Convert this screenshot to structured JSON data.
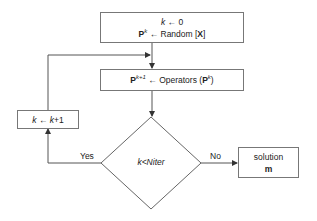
{
  "diagram": {
    "type": "flowchart",
    "init_box": {
      "line1": {
        "var": "k",
        "arrow": "←",
        "value": "0"
      },
      "line2": {
        "var": "P",
        "sup": "k",
        "arrow": "←",
        "func": "Random [",
        "arg": "X",
        "close": "]"
      }
    },
    "operators_box": {
      "var": "P",
      "sup": "k+1",
      "arrow": "←",
      "func": "Operators (",
      "arg": "P",
      "arg_sup": "k",
      "close": ")"
    },
    "increment_box": {
      "var": "k",
      "arrow": "←",
      "expr_var": "k",
      "expr_rest": "+1"
    },
    "decision": {
      "label": "k<Niter"
    },
    "solution_box": {
      "line1": "solution",
      "line2": "m"
    },
    "edges": {
      "yes_label": "Yes",
      "no_label": "No"
    },
    "colors": {
      "line": "#555555",
      "box_border": "#777777",
      "text": "#222222"
    }
  }
}
